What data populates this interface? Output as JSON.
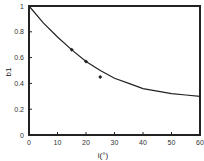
{
  "chart_data": {
    "type": "scatter",
    "title": "",
    "xlabel": "i(°)",
    "ylabel": "b1",
    "xlim": [
      0,
      60
    ],
    "ylim": [
      0,
      1
    ],
    "xticks": [
      0,
      10,
      20,
      30,
      40,
      50,
      60
    ],
    "yticks": [
      0,
      0.2,
      0.4,
      0.6,
      0.8,
      1
    ],
    "ytick_labels": [
      "0",
      "0.2",
      "0.4",
      "0.6",
      "0.8",
      "1"
    ],
    "grid": false,
    "legend": null,
    "series": [
      {
        "name": "measured",
        "kind": "points",
        "marker": "diamond",
        "x": [
          15,
          20,
          25
        ],
        "y": [
          0.66,
          0.57,
          0.45
        ]
      },
      {
        "name": "fitted curve",
        "kind": "line",
        "x": [
          0,
          5,
          10,
          15,
          20,
          25,
          30,
          35,
          40,
          45,
          50,
          55,
          60
        ],
        "y": [
          1.0,
          0.87,
          0.76,
          0.66,
          0.57,
          0.5,
          0.44,
          0.4,
          0.36,
          0.34,
          0.32,
          0.31,
          0.3
        ]
      }
    ]
  },
  "colors": {
    "axis": "#222222",
    "line": "#222222",
    "marker": "#222222",
    "background": "#ffffff"
  }
}
